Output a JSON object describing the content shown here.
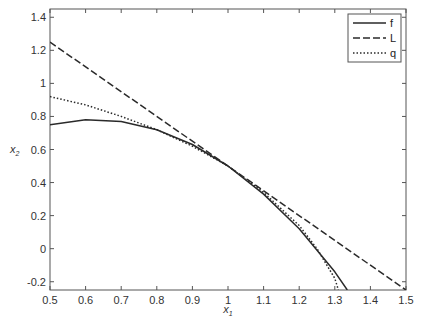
{
  "chart_data": {
    "type": "line",
    "title": "",
    "xlabel": "x1",
    "ylabel": "x2",
    "xlim": [
      0.5,
      1.5
    ],
    "ylim": [
      -0.25,
      1.45
    ],
    "grid": false,
    "legend_position": "upper right",
    "x_ticks": [
      "0.5",
      "0.6",
      "0.7",
      "0.8",
      "0.9",
      "1",
      "1.1",
      "1.2",
      "1.3",
      "1.4",
      "1.5"
    ],
    "y_ticks": [
      "-0.2",
      "0",
      "0.2",
      "0.4",
      "0.6",
      "0.8",
      "1",
      "1.2",
      "1.4"
    ],
    "series": [
      {
        "name": "f",
        "style": "solid",
        "x": [
          0.5,
          0.6,
          0.7,
          0.8,
          0.9,
          1.0,
          1.1,
          1.2,
          1.25,
          1.3,
          1.335
        ],
        "y": [
          0.75,
          0.78,
          0.77,
          0.72,
          0.63,
          0.5,
          0.33,
          0.12,
          -0.01,
          -0.14,
          -0.25
        ]
      },
      {
        "name": "L",
        "style": "dashed",
        "x": [
          0.5,
          1.0,
          1.5
        ],
        "y": [
          1.25,
          0.5,
          -0.25
        ]
      },
      {
        "name": "q",
        "style": "dotted",
        "x": [
          0.5,
          0.6,
          0.7,
          0.8,
          0.9,
          1.0,
          1.1,
          1.2,
          1.25,
          1.3,
          1.31
        ],
        "y": [
          0.92,
          0.87,
          0.8,
          0.72,
          0.62,
          0.5,
          0.34,
          0.14,
          0.0,
          -0.18,
          -0.25
        ]
      }
    ]
  },
  "axes": {
    "xlabel_main": "x",
    "xlabel_sub": "1",
    "ylabel_main": "x",
    "ylabel_sub": "2"
  },
  "legend": {
    "items": [
      {
        "label": "f",
        "style": "solid"
      },
      {
        "label": "L",
        "style": "dashed"
      },
      {
        "label": "q",
        "style": "dotted"
      }
    ]
  },
  "colors": {
    "line": "#2a2a2a",
    "axis": "#555555"
  }
}
